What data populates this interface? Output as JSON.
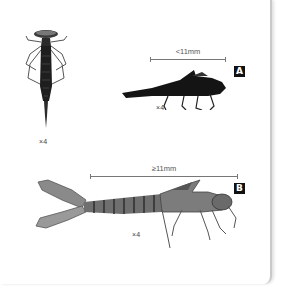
{
  "figure": {
    "specimen_top_view": {
      "magnification": "×4"
    },
    "specimen_a": {
      "label": "A",
      "scale": "<11mm",
      "magnification": "×4"
    },
    "specimen_b": {
      "label": "B",
      "scale": "≥11mm",
      "magnification": "×4"
    }
  }
}
